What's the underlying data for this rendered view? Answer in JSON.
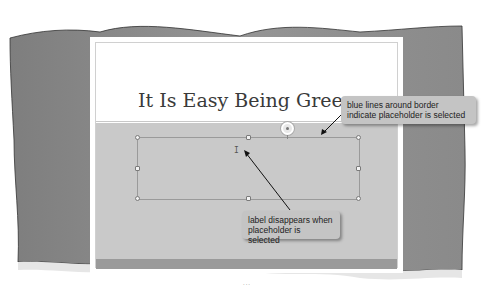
{
  "slide": {
    "title": "It Is Easy Being Green"
  },
  "callouts": [
    {
      "text": "blue lines around border indicate placeholder is selected"
    },
    {
      "text": "label disappears when placeholder is selected"
    }
  ],
  "footer": {
    "splitter": "..."
  },
  "colors": {
    "torn_background": "#8c8c8c",
    "slide_body": "#c9c9c9",
    "callout_bg": "#c4c4c4"
  }
}
